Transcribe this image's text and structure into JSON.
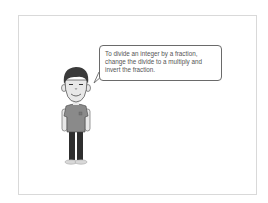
{
  "speech_bubble": {
    "text": "To divide an integer by a fraction, change the divide to a multiply and invert the fraction."
  },
  "character": {
    "description": "cartoon boy standing",
    "colors": {
      "hair": "#3a3a3a",
      "skin": "#e8e8e8",
      "shirt": "#8a8a8a",
      "pants": "#2e2e2e",
      "shoes": "#d8d8d8"
    }
  }
}
